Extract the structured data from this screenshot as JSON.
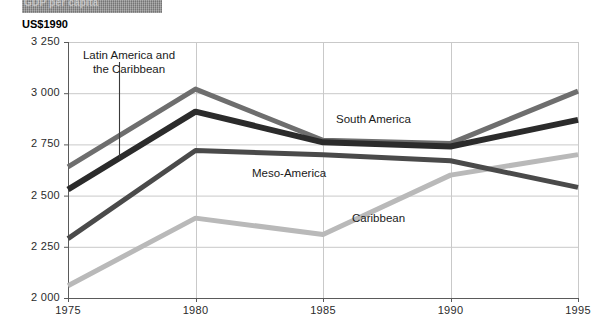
{
  "banner": {
    "text": "GDP per capita"
  },
  "axis_unit_label": "US$1990",
  "annotations": {
    "latin_america": "Latin America and\nthe Caribbean"
  },
  "series_labels": {
    "south_america": "South America",
    "meso_america": "Meso-America",
    "caribbean": "Caribbean"
  },
  "colors": {
    "latin_america": "#2b2b2b",
    "south_america": "#6e6e6e",
    "meso_america": "#4a4a4a",
    "caribbean": "#b9b9b9",
    "grid": "#c9c9c9",
    "axis": "#5a5a5a",
    "banner": "#8d8d8d"
  },
  "chart_data": {
    "type": "line",
    "title": "GDP per capita",
    "subtitle": "",
    "xlabel": "",
    "ylabel": "US$1990",
    "x": [
      1975,
      1980,
      1985,
      1990,
      1995
    ],
    "xticklabels": [
      "1975",
      "1980",
      "1985",
      "1990",
      "1995"
    ],
    "yticks": [
      2000,
      2250,
      2500,
      2750,
      3000,
      3250
    ],
    "yticklabels": [
      "2 000",
      "2 250",
      "2 500",
      "2 750",
      "3 000",
      "3 250"
    ],
    "ylim": [
      2000,
      3250
    ],
    "xlim": [
      1975,
      1995
    ],
    "grid": true,
    "legend": "inline-labels",
    "series": [
      {
        "name": "Latin America and the Caribbean",
        "values": [
          2530,
          2910,
          2760,
          2740,
          2870
        ],
        "color": "#2b2b2b",
        "width": 6
      },
      {
        "name": "South America",
        "values": [
          2640,
          3020,
          2770,
          2755,
          3010
        ],
        "color": "#6e6e6e",
        "width": 5
      },
      {
        "name": "Meso-America",
        "values": [
          2290,
          2720,
          2700,
          2670,
          2540
        ],
        "color": "#4a4a4a",
        "width": 5
      },
      {
        "name": "Caribbean",
        "values": [
          2060,
          2390,
          2310,
          2600,
          2700
        ],
        "color": "#b9b9b9",
        "width": 5
      }
    ]
  }
}
